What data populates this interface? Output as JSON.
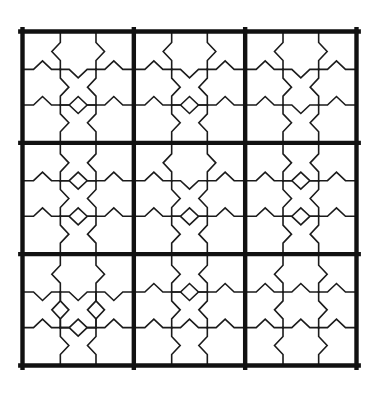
{
  "figure": {
    "background_color": "#ffffff",
    "line_color": "#1b1b1b",
    "thick_line_color": "#111111",
    "canvas": {
      "width": 378,
      "height": 404
    },
    "outer": {
      "x": 22.5,
      "y": 31.5,
      "size": 334
    },
    "grid": {
      "rows": 3,
      "cols": 3,
      "subtiles": 3
    },
    "stroke": {
      "thick": 4.4,
      "thin": 1.6
    },
    "chevron": {
      "half_base": 9,
      "depth": 8.5
    },
    "edge_order": [
      "vA_L",
      "vA_R",
      "h1_L",
      "h1_M",
      "h1_R",
      "vB_L",
      "vB_R",
      "h2_L",
      "h2_M",
      "h2_R",
      "vC_L",
      "vC_R"
    ],
    "legend": {
      "U": "chevron-up",
      "D": "chevron-down",
      "L": "chevron-left",
      "R": "chevron-right",
      "X": "diamond-both"
    },
    "cells": [
      [
        "L",
        "R",
        "U",
        "D",
        "U",
        "R",
        "L",
        "U",
        "X",
        "U",
        "R",
        "L"
      ],
      [
        "L",
        "R",
        "U",
        "D",
        "U",
        "R",
        "L",
        "U",
        "X",
        "U",
        "R",
        "L"
      ],
      [
        "L",
        "R",
        "U",
        "D",
        "U",
        "R",
        "L",
        "U",
        "D",
        "U",
        "R",
        "L"
      ],
      [
        "R",
        "L",
        "U",
        "X",
        "U",
        "R",
        "L",
        "U",
        "X",
        "U",
        "R",
        "L"
      ],
      [
        "L",
        "R",
        "U",
        "D",
        "U",
        "R",
        "L",
        "U",
        "X",
        "U",
        "R",
        "L"
      ],
      [
        "R",
        "L",
        "U",
        "X",
        "U",
        "R",
        "L",
        "U",
        "X",
        "U",
        "R",
        "L"
      ],
      [
        "L",
        "R",
        "D",
        "D",
        "D",
        "X",
        "X",
        "U",
        "X",
        "U",
        "R",
        "L"
      ],
      [
        "R",
        "L",
        "U",
        "X",
        "U",
        "R",
        "L",
        "U",
        "U",
        "U",
        "R",
        "L"
      ],
      [
        "L",
        "R",
        "U",
        "U",
        "U",
        "L",
        "R",
        "U",
        "U",
        "U",
        "L",
        "R"
      ]
    ]
  }
}
